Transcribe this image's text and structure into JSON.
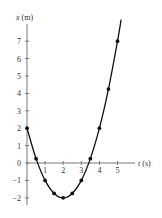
{
  "chart_data": {
    "type": "line",
    "title": "",
    "xlabel_var": "t",
    "xlabel_unit": "(s)",
    "ylabel_var": "x",
    "ylabel_unit": "(m)",
    "x": [
      0,
      0.5,
      1,
      1.5,
      2,
      2.5,
      3,
      3.5,
      4,
      4.5,
      5
    ],
    "values": [
      2,
      0.25,
      -1,
      -1.75,
      -2,
      -1.75,
      -1,
      0.25,
      2,
      4.25,
      7
    ],
    "curve_t_end": 5.2,
    "x_ticks": [
      "1",
      "2",
      "3",
      "4",
      "5"
    ],
    "y_ticks": [
      "7",
      "6",
      "5",
      "4",
      "3",
      "2",
      "1",
      "0",
      "-1",
      "-2"
    ],
    "xlim": [
      0,
      5.8
    ],
    "ylim": [
      -3,
      8
    ],
    "grid": false,
    "markers": true
  }
}
